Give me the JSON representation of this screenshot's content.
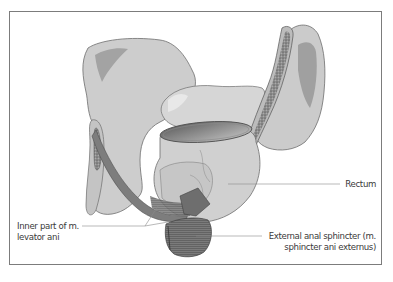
{
  "figure": {
    "labels": {
      "rectum": "Rectum",
      "levator_line1": "Inner part of m.",
      "levator_line2": "levator ani",
      "sphincter_line1": "External anal sphincter (m.",
      "sphincter_line2": "sphincter ani externus)"
    },
    "colors": {
      "bone": "#cfcfcf",
      "bone_shadow": "#9d9d9d",
      "bone_outline": "#6d6d6d",
      "muscle": "#8a8a8a",
      "muscle_dark": "#5c5c5c",
      "rectum": "#d2d2d2",
      "leader_line": "#8a8a8a",
      "frame": "#7c7c7c",
      "text": "#3a3a3a"
    }
  }
}
